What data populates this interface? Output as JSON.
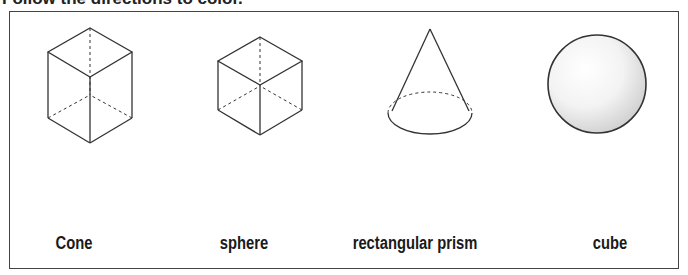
{
  "title": "Follow the directions to color.",
  "shapes": [
    {
      "id": "rectangular-prism",
      "label": "Cone"
    },
    {
      "id": "cube",
      "label": "sphere"
    },
    {
      "id": "cone",
      "label": "rectangular prism"
    },
    {
      "id": "sphere",
      "label": "cube"
    }
  ],
  "colors": {
    "stroke": "#333333",
    "frame": "#444444"
  }
}
